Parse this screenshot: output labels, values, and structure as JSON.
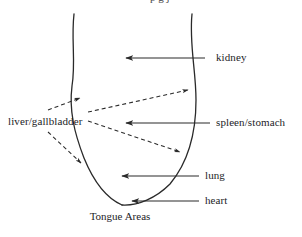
{
  "figure": {
    "caption": "Tongue Areas",
    "top_cropped_text": "p g j",
    "background_color": "#ffffff",
    "line_color": "#2a2a2a",
    "text_color": "#1d1d1f",
    "labels": {
      "kidney": "kidney",
      "spleen_stomach": "spleen/stomach",
      "lung": "lung",
      "heart": "heart",
      "liver_gallbladder": "liver/gallbladder"
    },
    "diagram_data": {
      "type": "annotated-diagram",
      "subject": "tongue",
      "outline": {
        "left_edge": "M 74 14 C 71 40, 76 62, 72 86 C 69 110, 74 132, 84 158 C 93 180, 106 198, 122 205",
        "right_edge": "M 192 14 C 189 44, 196 70, 196 100 C 196 130, 190 160, 170 184 C 156 198, 138 206, 122 205"
      },
      "solid_arrows": [
        {
          "name": "kidney",
          "from_x": 205,
          "from_y": 58,
          "to_x": 124,
          "to_y": 58
        },
        {
          "name": "spleen/stomach",
          "from_x": 210,
          "from_y": 123,
          "to_x": 124,
          "to_y": 123
        },
        {
          "name": "lung",
          "from_x": 199,
          "from_y": 176,
          "to_x": 120,
          "to_y": 176
        },
        {
          "name": "heart",
          "from_x": 199,
          "from_y": 201,
          "to_x": 130,
          "to_y": 201
        }
      ],
      "dashed_arrows": [
        {
          "name": "liver-gallbladder-upper-left",
          "from_x": 48,
          "from_y": 110,
          "to_x": 82,
          "to_y": 97
        },
        {
          "name": "liver-gallbladder-upper-right",
          "from_x": 88,
          "from_y": 112,
          "to_x": 190,
          "to_y": 89
        },
        {
          "name": "liver-gallbladder-lower-right",
          "from_x": 88,
          "from_y": 121,
          "to_x": 182,
          "to_y": 153
        },
        {
          "name": "liver-gallbladder-lower-left",
          "from_x": 48,
          "from_y": 132,
          "to_x": 83,
          "to_y": 165
        }
      ]
    }
  }
}
